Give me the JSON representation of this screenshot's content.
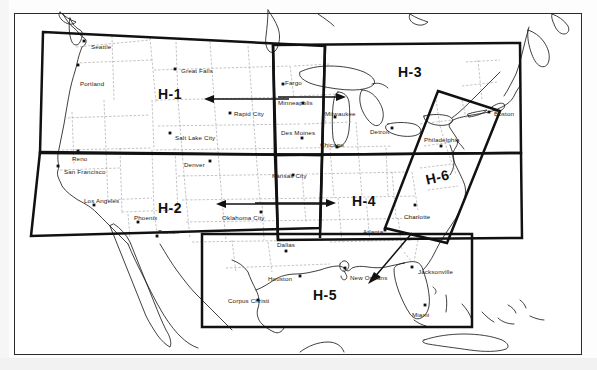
{
  "figure": {
    "kind": "scanned-map",
    "background_color": "#ffffff",
    "ink_color": "#111111",
    "state_border_color": "#9a9a9a"
  },
  "regions": [
    {
      "id": "H-1",
      "label": "H-1",
      "description": "Pacific Northwest / Northern Rockies box",
      "x": 158,
      "y": 86,
      "rotated": false
    },
    {
      "id": "H-2",
      "label": "H-2",
      "description": "Southwest box",
      "x": 158,
      "y": 200,
      "rotated": false
    },
    {
      "id": "H-3",
      "label": "H-3",
      "description": "Great Lakes / Northeast box",
      "x": 398,
      "y": 64,
      "rotated": false
    },
    {
      "id": "H-4",
      "label": "H-4",
      "description": "South central / Southeast box",
      "x": 352,
      "y": 193,
      "rotated": false
    },
    {
      "id": "H-5",
      "label": "H-5",
      "description": "Gulf Coast box",
      "x": 313,
      "y": 287,
      "rotated": false
    },
    {
      "id": "H-6",
      "label": "H-6",
      "description": "Atlantic seaboard tilted box",
      "x": 424,
      "y": 172,
      "rotated": true
    }
  ],
  "cities": [
    {
      "name": "Seattle",
      "label_x": 91,
      "label_y": 43,
      "dot_x": 84,
      "dot_y": 41
    },
    {
      "name": "Portland",
      "label_x": 80,
      "label_y": 80,
      "dot_x": 78,
      "dot_y": 65
    },
    {
      "name": "Great Falls",
      "label_x": 181,
      "label_y": 67,
      "dot_x": 175,
      "dot_y": 69
    },
    {
      "name": "Rapid City",
      "label_x": 234,
      "label_y": 110,
      "dot_x": 230,
      "dot_y": 113
    },
    {
      "name": "Salt Lake City",
      "label_x": 175,
      "label_y": 134,
      "dot_x": 170,
      "dot_y": 133
    },
    {
      "name": "Reno",
      "label_x": 72,
      "label_y": 155,
      "dot_x": 78,
      "dot_y": 151
    },
    {
      "name": "San Francisco",
      "label_x": 64,
      "label_y": 168,
      "dot_x": 58,
      "dot_y": 166
    },
    {
      "name": "Los Angeles",
      "label_x": 84,
      "label_y": 197,
      "dot_x": 94,
      "dot_y": 205
    },
    {
      "name": "Phoenix",
      "label_x": 134,
      "label_y": 214,
      "dot_x": 138,
      "dot_y": 222
    },
    {
      "name": "Tucson",
      "label_x": 158,
      "label_y": 228,
      "dot_x": 157,
      "dot_y": 236
    },
    {
      "name": "Denver",
      "label_x": 184,
      "label_y": 161,
      "dot_x": 210,
      "dot_y": 161
    },
    {
      "name": "Fargo",
      "label_x": 285,
      "label_y": 79,
      "dot_x": 283,
      "dot_y": 84
    },
    {
      "name": "Minneapolis",
      "label_x": 278,
      "label_y": 99,
      "dot_x": 303,
      "dot_y": 103
    },
    {
      "name": "Des Moines",
      "label_x": 281,
      "label_y": 129,
      "dot_x": 302,
      "dot_y": 138
    },
    {
      "name": "Milwaukee",
      "label_x": 325,
      "label_y": 110,
      "dot_x": 335,
      "dot_y": 117
    },
    {
      "name": "Chicago",
      "label_x": 320,
      "label_y": 141,
      "dot_x": 337,
      "dot_y": 147
    },
    {
      "name": "Detroit",
      "label_x": 370,
      "label_y": 128,
      "dot_x": 392,
      "dot_y": 128
    },
    {
      "name": "Boston",
      "label_x": 494,
      "label_y": 110,
      "dot_x": 489,
      "dot_y": 112
    },
    {
      "name": "Philadelphia",
      "label_x": 424,
      "label_y": 136,
      "dot_x": 441,
      "dot_y": 146
    },
    {
      "name": "Kansas City",
      "label_x": 272,
      "label_y": 172,
      "dot_x": 293,
      "dot_y": 175
    },
    {
      "name": "Oklahoma City",
      "label_x": 222,
      "label_y": 214,
      "dot_x": 261,
      "dot_y": 212
    },
    {
      "name": "Dallas",
      "label_x": 277,
      "label_y": 241,
      "dot_x": 286,
      "dot_y": 251
    },
    {
      "name": "Houston",
      "label_x": 268,
      "label_y": 275,
      "dot_x": 300,
      "dot_y": 276
    },
    {
      "name": "Corpus Christi",
      "label_x": 228,
      "label_y": 297,
      "dot_x": 258,
      "dot_y": 300
    },
    {
      "name": "New Orleans",
      "label_x": 350,
      "label_y": 274,
      "dot_x": 345,
      "dot_y": 268
    },
    {
      "name": "Atlanta",
      "label_x": 363,
      "label_y": 228,
      "dot_x": 385,
      "dot_y": 230
    },
    {
      "name": "Charlotte",
      "label_x": 404,
      "label_y": 213,
      "dot_x": 415,
      "dot_y": 205
    },
    {
      "name": "Jacksonville",
      "label_x": 418,
      "label_y": 268,
      "dot_x": 412,
      "dot_y": 267
    },
    {
      "name": "Miami",
      "label_x": 412,
      "label_y": 311,
      "dot_x": 425,
      "dot_y": 305
    }
  ],
  "annotations": [
    {
      "name": "arrow-into-h1",
      "type": "arrow",
      "from_x": 289,
      "from_y": 99,
      "to_x": 205,
      "to_y": 99,
      "direction": "left"
    },
    {
      "name": "arrow-into-h2",
      "type": "arrow",
      "from_x": 330,
      "from_y": 204,
      "to_x": 216,
      "to_y": 204,
      "direction": "left"
    },
    {
      "name": "arrow-into-h3",
      "type": "arrow",
      "from_x": 278,
      "from_y": 97,
      "to_x": 345,
      "to_y": 97,
      "direction": "right"
    },
    {
      "name": "arrow-into-h4",
      "type": "arrow",
      "from_x": 255,
      "from_y": 203,
      "to_x": 335,
      "to_y": 203,
      "direction": "right"
    },
    {
      "name": "arrow-into-h5",
      "type": "arrow",
      "from_x": 412,
      "from_y": 233,
      "to_x": 369,
      "to_y": 283,
      "direction": "down-left"
    }
  ]
}
